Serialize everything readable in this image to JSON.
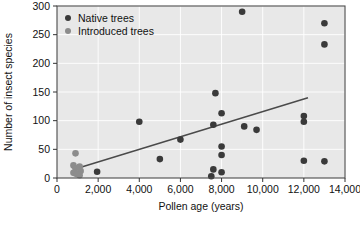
{
  "chart_data": {
    "type": "scatter",
    "title": "",
    "xlabel": "Pollen age (years)",
    "ylabel": "Number of insect species",
    "xlim": [
      0,
      14000
    ],
    "ylim": [
      0,
      300
    ],
    "xticks": [
      0,
      2000,
      4000,
      6000,
      8000,
      10000,
      12000,
      14000
    ],
    "xtick_labels": [
      "0",
      "2,000",
      "4,000",
      "6,000",
      "8,000",
      "10,000",
      "12,000",
      "14,000"
    ],
    "yticks": [
      0,
      50,
      100,
      150,
      200,
      250,
      300
    ],
    "ytick_labels": [
      "0",
      "50",
      "100",
      "150",
      "200",
      "250",
      "300"
    ],
    "grid": true,
    "legend_position": "top-left",
    "plot_background": "#e8e8e8",
    "series": [
      {
        "name": "Native trees",
        "color": "#3a3a3a",
        "marker": "circle",
        "points": [
          [
            1950,
            11
          ],
          [
            4000,
            98
          ],
          [
            5000,
            33
          ],
          [
            6000,
            67
          ],
          [
            7600,
            93
          ],
          [
            7600,
            15
          ],
          [
            7500,
            3
          ],
          [
            7700,
            148
          ],
          [
            8000,
            113
          ],
          [
            8000,
            55
          ],
          [
            8000,
            40
          ],
          [
            8000,
            10
          ],
          [
            9100,
            90
          ],
          [
            9000,
            290
          ],
          [
            9700,
            84
          ],
          [
            12000,
            108
          ],
          [
            12000,
            98
          ],
          [
            12000,
            30
          ],
          [
            13000,
            29
          ],
          [
            13000,
            270
          ],
          [
            13000,
            233
          ]
        ]
      },
      {
        "name": "Introduced trees",
        "color": "#8c8c8c",
        "marker": "circle",
        "points": [
          [
            900,
            43
          ],
          [
            800,
            22
          ],
          [
            900,
            17
          ],
          [
            1100,
            20
          ],
          [
            800,
            9
          ],
          [
            950,
            7
          ],
          [
            1150,
            12
          ],
          [
            1100,
            5
          ]
        ]
      }
    ],
    "trendline": {
      "x_start": 1000,
      "y_start": 17,
      "x_end": 12200,
      "y_end": 140,
      "color": "#4a4a4a"
    }
  },
  "legend": {
    "items": [
      {
        "label": "Native trees",
        "color": "#3a3a3a"
      },
      {
        "label": "Introduced trees",
        "color": "#8c8c8c"
      }
    ]
  },
  "axes": {
    "x_title": "Pollen age (years)",
    "y_title": "Number of insect species"
  }
}
